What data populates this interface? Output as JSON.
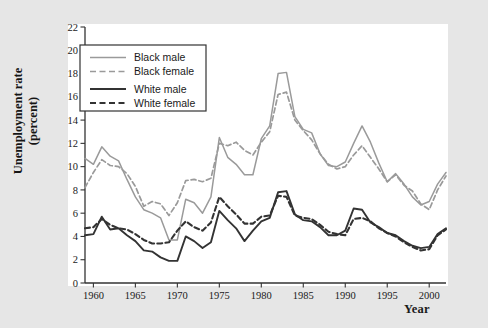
{
  "figure": {
    "background_color": "#e6e6e6",
    "plot_background_color": "#ffffff",
    "axis_color": "#333333",
    "xlabel": "Year",
    "ylabel_line1": "Unemployment rate",
    "ylabel_line2": "(percent)"
  },
  "legend": {
    "position": "top-left-inside",
    "entries": [
      {
        "label": "Black male",
        "color": "#9a9a9a",
        "style": "solid",
        "width": 1.6
      },
      {
        "label": "Black female",
        "color": "#9a9a9a",
        "style": "dashed",
        "width": 1.6
      },
      {
        "label": "White male",
        "color": "#333333",
        "style": "solid",
        "width": 1.9
      },
      {
        "label": "White female",
        "color": "#333333",
        "style": "dashed",
        "width": 1.9
      }
    ]
  },
  "chart_data": {
    "type": "line",
    "title": "",
    "xlabel": "Year",
    "ylabel": "Unemployment rate (percent)",
    "xlim": [
      1959,
      2002
    ],
    "ylim": [
      0,
      22
    ],
    "grid": false,
    "legend_position": "upper left",
    "xticks": [
      1960,
      1965,
      1970,
      1975,
      1980,
      1985,
      1990,
      1995,
      2000
    ],
    "yticks": [
      0,
      2,
      4,
      6,
      8,
      10,
      12,
      14,
      16,
      18,
      20,
      22
    ],
    "x": [
      1959,
      1960,
      1961,
      1962,
      1963,
      1964,
      1965,
      1966,
      1967,
      1968,
      1969,
      1970,
      1971,
      1972,
      1973,
      1974,
      1975,
      1976,
      1977,
      1978,
      1979,
      1980,
      1981,
      1982,
      1983,
      1984,
      1985,
      1986,
      1987,
      1988,
      1989,
      1990,
      1991,
      1992,
      1993,
      1994,
      1995,
      1996,
      1997,
      1998,
      1999,
      2000,
      2001,
      2002
    ],
    "series": [
      {
        "name": "Black male",
        "color": "#9a9a9a",
        "style": "solid",
        "values": [
          10.7,
          10.2,
          11.7,
          10.9,
          10.5,
          8.9,
          7.4,
          6.3,
          6.0,
          5.6,
          3.7,
          3.7,
          7.2,
          6.9,
          6.0,
          7.4,
          12.5,
          10.8,
          10.2,
          9.3,
          9.3,
          12.4,
          13.5,
          18.0,
          18.1,
          14.3,
          13.2,
          12.9,
          11.1,
          10.1,
          10.0,
          10.4,
          12.0,
          13.5,
          12.1,
          10.3,
          8.7,
          9.4,
          8.5,
          7.4,
          6.7,
          7.0,
          8.5,
          9.5
        ]
      },
      {
        "name": "Black female",
        "color": "#9a9a9a",
        "style": "dashed",
        "values": [
          8.2,
          9.5,
          10.6,
          10.1,
          10.0,
          9.4,
          8.3,
          6.6,
          7.0,
          6.8,
          5.8,
          6.9,
          8.8,
          8.9,
          8.7,
          9.0,
          12.0,
          11.8,
          12.1,
          11.4,
          11.0,
          12.1,
          13.0,
          16.2,
          16.4,
          14.0,
          13.1,
          12.3,
          11.1,
          10.2,
          9.8,
          10.0,
          11.0,
          11.8,
          10.8,
          9.8,
          8.7,
          9.3,
          8.4,
          7.9,
          6.8,
          6.3,
          8.0,
          9.2
        ]
      },
      {
        "name": "White male",
        "color": "#333333",
        "style": "solid",
        "values": [
          4.1,
          4.2,
          5.7,
          4.6,
          4.7,
          4.1,
          3.6,
          2.8,
          2.7,
          2.2,
          1.9,
          1.9,
          4.0,
          3.6,
          3.0,
          3.5,
          6.2,
          5.4,
          4.7,
          3.6,
          4.5,
          5.3,
          5.6,
          7.8,
          7.9,
          5.9,
          5.4,
          5.3,
          4.8,
          4.1,
          4.1,
          4.5,
          6.4,
          6.3,
          5.2,
          4.8,
          4.3,
          4.1,
          3.6,
          3.2,
          3.0,
          3.1,
          4.2,
          4.7
        ]
      },
      {
        "name": "White female",
        "color": "#333333",
        "style": "dashed",
        "values": [
          4.7,
          4.8,
          5.5,
          5.0,
          4.7,
          4.6,
          4.2,
          3.7,
          3.4,
          3.4,
          3.5,
          4.5,
          5.3,
          4.8,
          4.5,
          5.2,
          7.4,
          6.6,
          5.9,
          5.1,
          5.1,
          5.7,
          5.8,
          7.5,
          7.4,
          5.8,
          5.6,
          5.5,
          5.0,
          4.4,
          4.2,
          4.1,
          5.5,
          5.6,
          5.3,
          4.7,
          4.3,
          4.0,
          3.5,
          3.1,
          2.8,
          2.9,
          4.1,
          4.6
        ]
      }
    ]
  }
}
